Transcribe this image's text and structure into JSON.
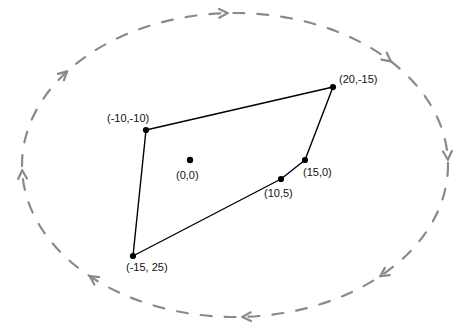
{
  "figure": {
    "background_color": "#ffffff",
    "width": 470,
    "height": 333
  },
  "colors": {
    "polygon_stroke": "#000000",
    "vertex_fill": "#000000",
    "label_text": "#111111",
    "orbit_dash": "#8a8a8a"
  },
  "polygon": {
    "name": "irregular-hexagon",
    "stroke_width": 1.4,
    "vertices": [
      {
        "label": "(-10,-10)",
        "x": 146,
        "y": 130,
        "label_x": 107,
        "label_y": 112
      },
      {
        "label": "(20,-15)",
        "x": 333,
        "y": 87,
        "label_x": 339,
        "label_y": 73
      },
      {
        "label": "(15,0)",
        "x": 305,
        "y": 160,
        "label_x": 303,
        "label_y": 166
      },
      {
        "label": "(10,5)",
        "x": 281,
        "y": 179,
        "label_x": 264,
        "label_y": 187
      },
      {
        "label": "(-15, 25)",
        "x": 133,
        "y": 256,
        "label_x": 126,
        "label_y": 261
      }
    ]
  },
  "center_point": {
    "label": "(0,0)",
    "x": 190,
    "y": 160,
    "label_x": 176,
    "label_y": 169,
    "radius": 3.2
  },
  "orbit": {
    "name": "dashed-rotation-ellipse",
    "center_x": 235,
    "center_y": 165,
    "radius_x": 213,
    "radius_y": 152,
    "stroke_width": 2.2,
    "dash_pattern": "11 13",
    "direction": "counterclockwise",
    "arrows": [
      {
        "name": "arrow-top",
        "angle_deg": 268,
        "direction": "left"
      },
      {
        "name": "arrow-upper-left",
        "angle_deg": 218,
        "direction": "up-left"
      },
      {
        "name": "arrow-left",
        "angle_deg": 178,
        "direction": "down"
      },
      {
        "name": "arrow-lower-left",
        "angle_deg": 133,
        "direction": "down-right"
      },
      {
        "name": "arrow-bottom",
        "angle_deg": 88,
        "direction": "right"
      },
      {
        "name": "arrow-lower-right",
        "angle_deg": 47,
        "direction": "up-right"
      },
      {
        "name": "arrow-right",
        "angle_deg": 358,
        "direction": "up"
      },
      {
        "name": "arrow-upper-right",
        "angle_deg": 317,
        "direction": "up-left"
      }
    ]
  }
}
